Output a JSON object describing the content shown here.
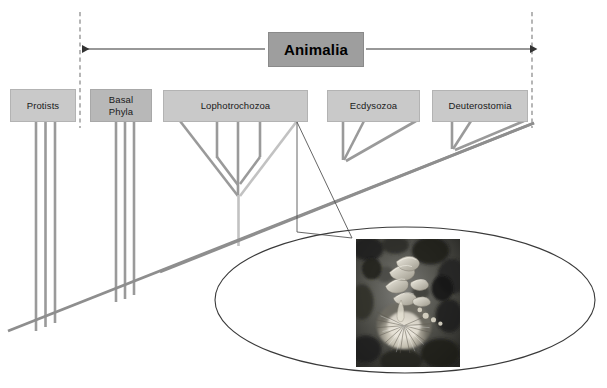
{
  "figure": {
    "type": "phylogenetic-tree-diagram",
    "title": "Animalia",
    "description": "Cladogram of eukaryotic lineages with Animalia bracket spanning Basal Phyla through Deuterostomia, with a magnified callout photograph of a lophotrochozoan (marine polychaete fan worm).",
    "background_color": "#ffffff"
  },
  "header": {
    "label": "Animalia",
    "box_color": "#9e9e9e",
    "border_color": "#8a8a8a",
    "text_color": "#000000",
    "bracket": {
      "left_arrow_label": "",
      "right_arrow_label": "",
      "line_color": "#3a3a3a",
      "left_boundary_x": 80,
      "right_boundary_x": 532
    }
  },
  "boundaries": {
    "dashed_color": "#8f8f8f",
    "left_label": "",
    "right_label": ""
  },
  "clades": [
    {
      "id": "protists",
      "label": "Protists",
      "inside_animalia": false,
      "box_color": "#c9c9c9",
      "tip_count": 3
    },
    {
      "id": "basal-phyla",
      "label": "Basal\nPhyla",
      "inside_animalia": true,
      "box_color": "#b8b8b8",
      "tip_count": 3
    },
    {
      "id": "lophotrochozoa",
      "label": "Lophotrochozoa",
      "inside_animalia": true,
      "box_color": "#c9c9c9",
      "tip_count": 6
    },
    {
      "id": "ecdysozoa",
      "label": "Ecdysozoa",
      "inside_animalia": true,
      "box_color": "#c9c9c9",
      "tip_count": 3
    },
    {
      "id": "deuterostomia",
      "label": "Deuterostomia",
      "inside_animalia": true,
      "box_color": "#c9c9c9",
      "tip_count": 3
    }
  ],
  "tree": {
    "branch_color": "#9a9a9a",
    "branch_color_light": "#c2c2c2",
    "trunk_color": "#8e8e8e",
    "trunk_start": [
      8,
      331
    ],
    "trunk_end": [
      534,
      123
    ]
  },
  "callout": {
    "shape": "ellipse",
    "outline_color": "#3a3a3a",
    "leader_color": "#5a5a5a",
    "source_point": [
      297,
      122
    ],
    "center": [
      405,
      300
    ],
    "radius_x": 190,
    "radius_y": 73,
    "photo": {
      "subject": "marine-fan-worm",
      "caption": "",
      "border_color": "#ffffff",
      "x": 355,
      "y": 238,
      "width": 106,
      "height": 130
    }
  },
  "icons": {
    "arrow_left": "arrow-left-icon",
    "arrow_right": "arrow-right-icon",
    "magnifier": "callout-ellipse-icon"
  }
}
